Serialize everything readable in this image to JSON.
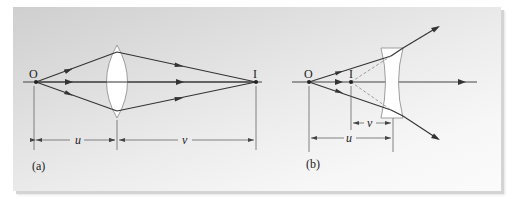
{
  "figure": {
    "panel_a": {
      "caption": "(a)",
      "object_label": "O",
      "image_label": "I",
      "lens_type": "converging (convex) lens",
      "object_distance_label": "u",
      "image_distance_label": "v"
    },
    "panel_b": {
      "caption": "(b)",
      "object_label": "O",
      "image_label": "I",
      "lens_type": "diverging (concave) lens",
      "object_distance_label": "u",
      "image_distance_label": "v"
    }
  },
  "colors": {
    "ray": "#333333",
    "lens_fill": "#ffffff",
    "lens_stroke": "#777777",
    "dashed": "#888888"
  }
}
